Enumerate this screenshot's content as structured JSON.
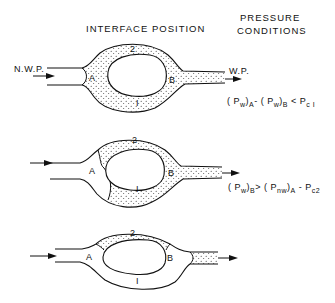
{
  "headers": {
    "interface_position": "INTERFACE POSITION",
    "pressure_conditions_line1": "PRESSURE",
    "pressure_conditions_line2": "CONDITIONS"
  },
  "labels": {
    "nwp": "N.W.P.",
    "wp": "W.P."
  },
  "diagrams": [
    {
      "id": 1,
      "labels": {
        "A": "A",
        "B": "B",
        "branch1": "I",
        "branch2": "2"
      },
      "condition": {
        "p1": "( P",
        "s1": "w",
        "p2": ")",
        "s2": "A",
        "p3": "- ( P",
        "s3": "w",
        "p4": ")",
        "s4": "B",
        "p5": " < P",
        "s5": "c I"
      }
    },
    {
      "id": 2,
      "labels": {
        "A": "A",
        "B": "B",
        "branch1": "I",
        "branch2": "2"
      },
      "condition": {
        "p1": "( P",
        "s1": "w",
        "p2": ")",
        "s2": "B",
        "p3": "> ( P",
        "s3": "nw",
        "p4": ")",
        "s4": "A",
        "p5": " - P",
        "s5": "c2"
      }
    },
    {
      "id": 3,
      "labels": {
        "A": "A",
        "B": "B",
        "branch1": "I",
        "branch2": "2"
      }
    }
  ]
}
